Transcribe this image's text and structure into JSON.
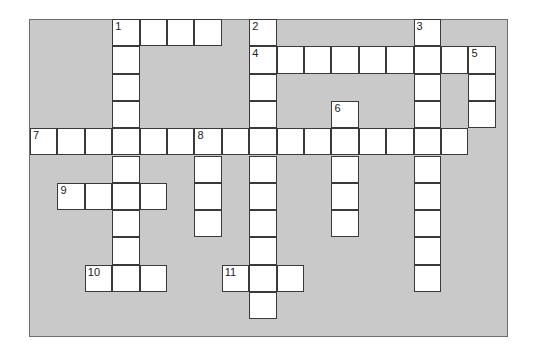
{
  "puzzle": {
    "type": "crossword",
    "grid": {
      "cols": 17,
      "rows": 11,
      "origin_x": 30,
      "origin_y": 19,
      "cell_w": 27.4,
      "cell_h": 27.3
    },
    "colors": {
      "background": "#ffffff",
      "board": "#c9c9c9",
      "cell": "#ffffff",
      "line": "#3a3a3a"
    },
    "words": [
      {
        "number": "1",
        "direction": "across",
        "row": 0,
        "col": 3,
        "length": 4
      },
      {
        "number": "1",
        "direction": "down",
        "row": 0,
        "col": 3,
        "length": 10
      },
      {
        "number": "2",
        "direction": "down",
        "row": 0,
        "col": 8,
        "length": 11
      },
      {
        "number": "3",
        "direction": "down",
        "row": 0,
        "col": 14,
        "length": 10
      },
      {
        "number": "4",
        "direction": "across",
        "row": 1,
        "col": 8,
        "length": 9
      },
      {
        "number": "5",
        "direction": "down",
        "row": 1,
        "col": 16,
        "length": 3
      },
      {
        "number": "6",
        "direction": "down",
        "row": 3,
        "col": 11,
        "length": 5
      },
      {
        "number": "7",
        "direction": "across",
        "row": 4,
        "col": 0,
        "length": 16
      },
      {
        "number": "8",
        "direction": "down",
        "row": 4,
        "col": 6,
        "length": 4
      },
      {
        "number": "9",
        "direction": "across",
        "row": 6,
        "col": 1,
        "length": 4
      },
      {
        "number": "10",
        "direction": "across",
        "row": 9,
        "col": 2,
        "length": 3
      },
      {
        "number": "11",
        "direction": "across",
        "row": 9,
        "col": 7,
        "length": 3
      }
    ]
  }
}
